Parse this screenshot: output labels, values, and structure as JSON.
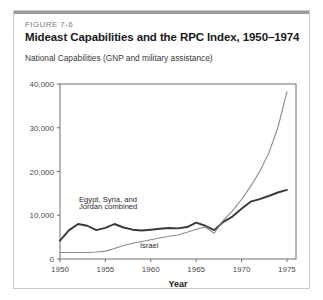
{
  "figure": {
    "number": "FIGURE 7-6",
    "title": "Mideast Capabilities and the RPC Index, 1950–1974",
    "subtitle": "National Capabilities (GNP and military assistance)"
  },
  "colors": {
    "arab_line": "#3a3a3a",
    "israel_line": "#8a8a8a",
    "frame": "#6f6f6f",
    "card_border": "#c9c9c9",
    "top_rule": "#9a9a9a",
    "figure_number_text": "#7d7d7d",
    "title_text": "#1a1a1a"
  },
  "chart_data": {
    "type": "line",
    "title": "Mideast Capabilities and the RPC Index, 1950–1974",
    "xlabel": "Year",
    "ylabel": "National Capabilities (GNP and military assistance)",
    "xlim": [
      1950,
      1976
    ],
    "ylim": [
      0,
      40000
    ],
    "xticks": [
      1950,
      1955,
      1960,
      1965,
      1970,
      1975
    ],
    "xtick_labels": [
      "1950",
      "1955",
      "1960",
      "1965",
      "1970",
      "1975"
    ],
    "yticks": [
      0,
      10000,
      20000,
      30000,
      40000
    ],
    "ytick_labels": [
      "0",
      "10,000",
      "20,000",
      "30,000",
      "40,000"
    ],
    "grid": false,
    "legend": "inline-annotations",
    "annotations": [
      {
        "text": "Egypt, Syria, and",
        "x": 1952.1,
        "y": 13100
      },
      {
        "text": "Jordan combined",
        "x": 1952.1,
        "y": 11400
      },
      {
        "text": "Israel",
        "x": 1958.8,
        "y": 2600
      }
    ],
    "x": [
      1950,
      1951,
      1952,
      1953,
      1954,
      1955,
      1956,
      1957,
      1958,
      1959,
      1960,
      1961,
      1962,
      1963,
      1964,
      1965,
      1966,
      1967,
      1968,
      1969,
      1970,
      1971,
      1972,
      1973,
      1974,
      1975
    ],
    "series": [
      {
        "name": "Egypt, Syria, and Jordan combined",
        "values": [
          4200,
          6600,
          8000,
          7600,
          6600,
          7100,
          8000,
          7200,
          6700,
          6500,
          6700,
          6900,
          7100,
          7000,
          7300,
          8300,
          7600,
          6600,
          8500,
          9700,
          11500,
          13100,
          13700,
          14400,
          15200,
          15800
        ]
      },
      {
        "name": "Israel",
        "values": [
          1500,
          1500,
          1500,
          1500,
          1600,
          1800,
          2400,
          3100,
          3600,
          4000,
          4400,
          4800,
          5200,
          5500,
          6100,
          6800,
          7300,
          5900,
          8900,
          11000,
          13600,
          16600,
          20000,
          24200,
          30000,
          38200
        ]
      }
    ]
  }
}
